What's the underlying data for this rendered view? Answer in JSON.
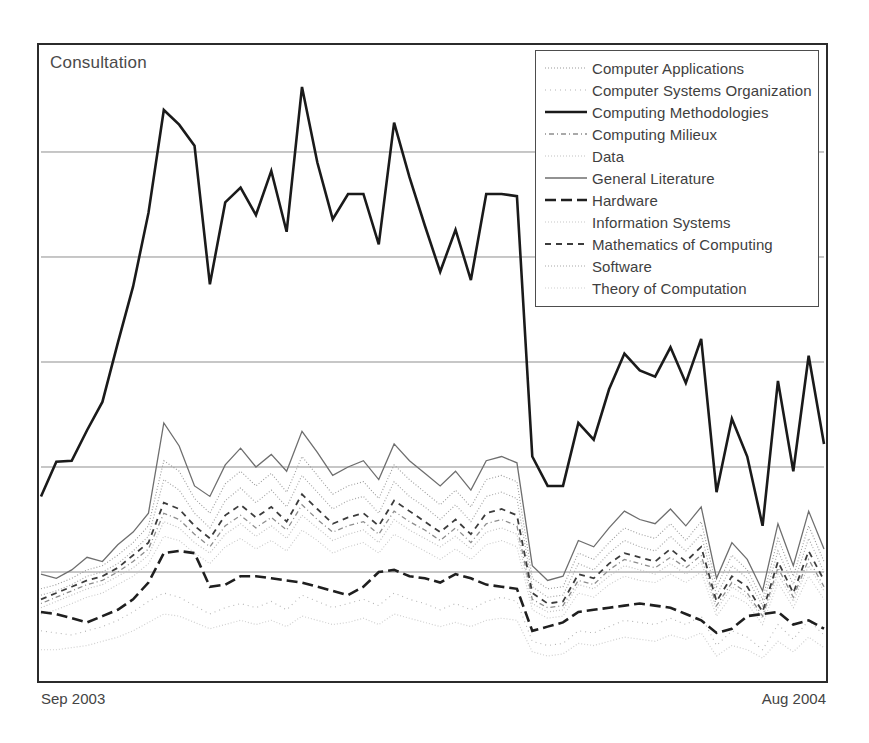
{
  "chart_title": "Consultation",
  "legend": {
    "position": "top-right",
    "items": [
      {
        "label": "Computer Applications",
        "style": "dotted-fine",
        "color": "#9a9a9a",
        "width": 1.1,
        "dash": "1,2"
      },
      {
        "label": "Computer Systems Organization",
        "style": "dotted-sparse",
        "color": "#b4b4b4",
        "width": 1.1,
        "dash": "1,4"
      },
      {
        "label": "Computing Methodologies",
        "style": "solid-heavy",
        "color": "#1a1a1a",
        "width": 2.6,
        "dash": "none"
      },
      {
        "label": "Computing Milieux",
        "style": "dash-dot",
        "color": "#8d8d8d",
        "width": 1.3,
        "dash": "1,3,5,3"
      },
      {
        "label": "Data",
        "style": "dotted-light",
        "color": "#c2c2c2",
        "width": 1.2,
        "dash": "1,2"
      },
      {
        "label": "General Literature",
        "style": "solid-thin",
        "color": "#6e6e6e",
        "width": 1.3,
        "dash": "none"
      },
      {
        "label": "Hardware",
        "style": "dashed-heavy",
        "color": "#1f1f1f",
        "width": 2.6,
        "dash": "11,5"
      },
      {
        "label": "Information Systems",
        "style": "dotted-faint",
        "color": "#c8c8c8",
        "width": 1.1,
        "dash": "1,2"
      },
      {
        "label": "Mathematics of Computing",
        "style": "dashed-medium",
        "color": "#3c3c3c",
        "width": 1.8,
        "dash": "6,5"
      },
      {
        "label": "Software",
        "style": "dotted-mid",
        "color": "#a8a8a8",
        "width": 1.2,
        "dash": "1,2"
      },
      {
        "label": "Theory of Computation",
        "style": "dotted-pale",
        "color": "#cfcfcf",
        "width": 1.2,
        "dash": "1,2"
      }
    ]
  },
  "xaxis": {
    "start_label": "Sep 2003",
    "end_label": "Aug 2004"
  },
  "chart_data": {
    "type": "line",
    "title": "Consultation",
    "xlabel": "",
    "ylabel": "",
    "grid": true,
    "gridlines_y": [
      5,
      4,
      3,
      2,
      1
    ],
    "ylim": [
      0,
      6
    ],
    "xlim": [
      0,
      51
    ],
    "x_tick_labels": [
      "Sep 2003",
      "Aug 2004"
    ],
    "x_description": "Weekly samples from Sep 2003 through Aug 2004 (52 points)",
    "legend_position": "top-right",
    "series": [
      {
        "name": "Computing Methodologies",
        "color": "#1a1a1a",
        "values": [
          1.72,
          2.05,
          2.06,
          2.35,
          2.62,
          3.18,
          3.72,
          4.42,
          5.4,
          5.26,
          5.06,
          3.74,
          4.52,
          4.66,
          4.4,
          4.82,
          4.24,
          5.62,
          4.9,
          4.36,
          4.6,
          4.6,
          4.12,
          5.28,
          4.76,
          4.3,
          3.86,
          4.26,
          3.78,
          4.6,
          4.6,
          4.58,
          2.1,
          1.82,
          1.82,
          2.42,
          2.26,
          2.74,
          3.08,
          2.92,
          2.86,
          3.14,
          2.8,
          3.22,
          1.76,
          2.46,
          2.1,
          1.44,
          2.82,
          1.96,
          3.06,
          2.22
        ]
      },
      {
        "name": "General Literature",
        "color": "#6e6e6e",
        "values": [
          0.98,
          0.94,
          1.02,
          1.14,
          1.1,
          1.26,
          1.38,
          1.56,
          2.42,
          2.2,
          1.82,
          1.72,
          2.02,
          2.18,
          2.0,
          2.12,
          1.96,
          2.34,
          2.14,
          1.92,
          2.0,
          2.06,
          1.88,
          2.22,
          2.06,
          1.94,
          1.82,
          1.96,
          1.78,
          2.06,
          2.1,
          2.04,
          1.06,
          0.92,
          0.96,
          1.3,
          1.24,
          1.42,
          1.58,
          1.5,
          1.46,
          1.6,
          1.44,
          1.62,
          0.94,
          1.28,
          1.12,
          0.82,
          1.46,
          1.06,
          1.58,
          1.22
        ]
      },
      {
        "name": "Computer Applications",
        "color": "#9a9a9a",
        "values": [
          0.84,
          0.88,
          0.94,
          1.02,
          1.06,
          1.16,
          1.28,
          1.44,
          2.06,
          1.96,
          1.7,
          1.56,
          1.84,
          1.96,
          1.82,
          1.94,
          1.76,
          2.1,
          1.92,
          1.74,
          1.82,
          1.86,
          1.7,
          2.02,
          1.88,
          1.76,
          1.64,
          1.78,
          1.62,
          1.88,
          1.92,
          1.86,
          0.94,
          0.84,
          0.86,
          1.18,
          1.12,
          1.28,
          1.42,
          1.36,
          1.32,
          1.46,
          1.3,
          1.48,
          0.86,
          1.16,
          1.02,
          0.74,
          1.32,
          0.96,
          1.44,
          1.1
        ]
      },
      {
        "name": "Software",
        "color": "#a8a8a8",
        "values": [
          0.78,
          0.82,
          0.88,
          0.96,
          1.0,
          1.08,
          1.2,
          1.34,
          1.88,
          1.78,
          1.56,
          1.42,
          1.68,
          1.8,
          1.66,
          1.78,
          1.62,
          1.92,
          1.76,
          1.6,
          1.68,
          1.72,
          1.56,
          1.86,
          1.72,
          1.62,
          1.5,
          1.64,
          1.48,
          1.72,
          1.76,
          1.7,
          0.86,
          0.76,
          0.78,
          1.08,
          1.02,
          1.18,
          1.3,
          1.24,
          1.2,
          1.34,
          1.2,
          1.36,
          0.78,
          1.06,
          0.94,
          0.68,
          1.2,
          0.88,
          1.32,
          1.0
        ]
      },
      {
        "name": "Mathematics of Computing",
        "color": "#3c3c3c",
        "values": [
          0.74,
          0.8,
          0.86,
          0.92,
          0.96,
          1.04,
          1.16,
          1.28,
          1.66,
          1.6,
          1.44,
          1.32,
          1.54,
          1.64,
          1.52,
          1.62,
          1.48,
          1.74,
          1.6,
          1.46,
          1.52,
          1.56,
          1.44,
          1.68,
          1.58,
          1.48,
          1.38,
          1.5,
          1.36,
          1.56,
          1.6,
          1.54,
          0.8,
          0.7,
          0.72,
          0.98,
          0.94,
          1.08,
          1.18,
          1.14,
          1.1,
          1.22,
          1.1,
          1.24,
          0.72,
          0.96,
          0.86,
          0.62,
          1.1,
          0.8,
          1.2,
          0.92
        ]
      },
      {
        "name": "Computing Milieux",
        "color": "#8d8d8d",
        "values": [
          0.7,
          0.76,
          0.82,
          0.88,
          0.92,
          1.0,
          1.1,
          1.22,
          1.56,
          1.5,
          1.36,
          1.24,
          1.44,
          1.54,
          1.42,
          1.52,
          1.4,
          1.64,
          1.5,
          1.38,
          1.44,
          1.48,
          1.36,
          1.58,
          1.48,
          1.4,
          1.3,
          1.42,
          1.28,
          1.46,
          1.5,
          1.44,
          0.74,
          0.66,
          0.68,
          0.92,
          0.88,
          1.02,
          1.12,
          1.08,
          1.04,
          1.14,
          1.04,
          1.16,
          0.68,
          0.9,
          0.8,
          0.58,
          1.04,
          0.76,
          1.12,
          0.86
        ]
      },
      {
        "name": "Data",
        "color": "#c2c2c2",
        "values": [
          0.66,
          0.72,
          0.78,
          0.84,
          0.88,
          0.96,
          1.04,
          1.16,
          1.48,
          1.42,
          1.28,
          1.18,
          1.36,
          1.46,
          1.34,
          1.44,
          1.32,
          1.54,
          1.42,
          1.3,
          1.36,
          1.4,
          1.28,
          1.5,
          1.4,
          1.32,
          1.24,
          1.34,
          1.22,
          1.38,
          1.42,
          1.36,
          0.7,
          0.62,
          0.64,
          0.88,
          0.84,
          0.96,
          1.06,
          1.02,
          0.98,
          1.08,
          0.98,
          1.1,
          0.64,
          0.86,
          0.76,
          0.56,
          0.98,
          0.72,
          1.06,
          0.82
        ]
      },
      {
        "name": "Hardware",
        "color": "#1f1f1f",
        "values": [
          0.62,
          0.6,
          0.56,
          0.52,
          0.58,
          0.64,
          0.74,
          0.9,
          1.18,
          1.2,
          1.18,
          0.86,
          0.88,
          0.96,
          0.96,
          0.94,
          0.92,
          0.9,
          0.86,
          0.82,
          0.78,
          0.86,
          1.0,
          1.02,
          0.96,
          0.94,
          0.9,
          0.98,
          0.94,
          0.88,
          0.86,
          0.84,
          0.44,
          0.48,
          0.52,
          0.62,
          0.64,
          0.66,
          0.68,
          0.7,
          0.68,
          0.66,
          0.6,
          0.54,
          0.42,
          0.46,
          0.58,
          0.6,
          0.62,
          0.5,
          0.54,
          0.46
        ]
      },
      {
        "name": "Information Systems",
        "color": "#c8c8c8",
        "values": [
          0.6,
          0.64,
          0.7,
          0.76,
          0.8,
          0.88,
          0.96,
          1.08,
          1.34,
          1.3,
          1.18,
          1.08,
          1.24,
          1.32,
          1.22,
          1.3,
          1.2,
          1.4,
          1.3,
          1.18,
          1.24,
          1.28,
          1.18,
          1.36,
          1.28,
          1.2,
          1.12,
          1.22,
          1.12,
          1.26,
          1.3,
          1.24,
          0.64,
          0.56,
          0.58,
          0.8,
          0.76,
          0.88,
          0.96,
          0.92,
          0.9,
          0.98,
          0.9,
          1.0,
          0.58,
          0.78,
          0.7,
          0.5,
          0.9,
          0.66,
          0.96,
          0.74
        ]
      },
      {
        "name": "Computer Systems Organization",
        "color": "#b4b4b4",
        "values": [
          0.44,
          0.42,
          0.4,
          0.44,
          0.48,
          0.54,
          0.62,
          0.72,
          0.8,
          0.76,
          0.68,
          0.6,
          0.66,
          0.7,
          0.66,
          0.72,
          0.64,
          0.78,
          0.72,
          0.66,
          0.7,
          0.74,
          0.68,
          0.8,
          0.74,
          0.7,
          0.64,
          0.7,
          0.64,
          0.72,
          0.76,
          0.72,
          0.34,
          0.3,
          0.32,
          0.44,
          0.42,
          0.48,
          0.54,
          0.52,
          0.5,
          0.56,
          0.5,
          0.58,
          0.3,
          0.44,
          0.38,
          0.26,
          0.5,
          0.36,
          0.54,
          0.4
        ]
      },
      {
        "name": "Theory of Computation",
        "color": "#cfcfcf",
        "values": [
          0.26,
          0.26,
          0.28,
          0.3,
          0.34,
          0.38,
          0.44,
          0.52,
          0.6,
          0.58,
          0.52,
          0.46,
          0.5,
          0.54,
          0.5,
          0.54,
          0.48,
          0.58,
          0.54,
          0.5,
          0.52,
          0.56,
          0.5,
          0.6,
          0.56,
          0.52,
          0.48,
          0.52,
          0.48,
          0.54,
          0.56,
          0.54,
          0.24,
          0.2,
          0.22,
          0.32,
          0.3,
          0.34,
          0.38,
          0.36,
          0.34,
          0.4,
          0.36,
          0.42,
          0.2,
          0.3,
          0.26,
          0.18,
          0.34,
          0.24,
          0.38,
          0.28
        ]
      }
    ]
  }
}
